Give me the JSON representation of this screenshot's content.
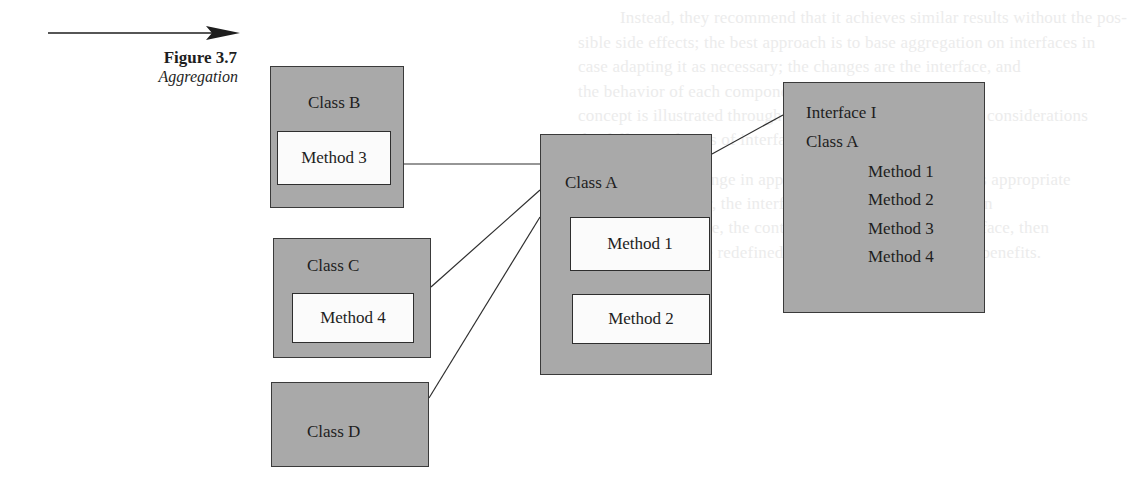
{
  "figure": {
    "title": "Figure 3.7",
    "subtitle": "Aggregation"
  },
  "background_text": [
    "Instead, they recommend that it achieves similar results without the pos-",
    "sible side effects; the best approach is to base aggregation on interfaces in",
    "case adapting it as necessary; the changes are the interface, and",
    "the behavior of each component as needed. This",
    "concept is illustrated through the diagram that follows the considerations",
    "the different classes of interfaces as containers.",
    "This simple change in approach supports all the classes appropriate",
    "and more; however, the interface must define the definition",
    "of the base interface, the container of a class to have interface, then",
    "does not need to be redefined; this approach provides the benefits."
  ],
  "diagram": {
    "class_b": {
      "name": "Class B",
      "method": "Method 3"
    },
    "class_c": {
      "name": "Class C",
      "method": "Method 4"
    },
    "class_d": {
      "name": "Class D"
    },
    "class_a": {
      "name": "Class A",
      "methods": [
        "Method 1",
        "Method 2"
      ]
    },
    "interface": {
      "name": "Interface I",
      "class": "Class A",
      "methods": [
        "Method 1",
        "Method 2",
        "Method 3",
        "Method 4"
      ]
    },
    "colors": {
      "box_fill": "#a9a9a9",
      "inner_fill": "#fbfbfb",
      "stroke": "#2e2e2e"
    }
  }
}
